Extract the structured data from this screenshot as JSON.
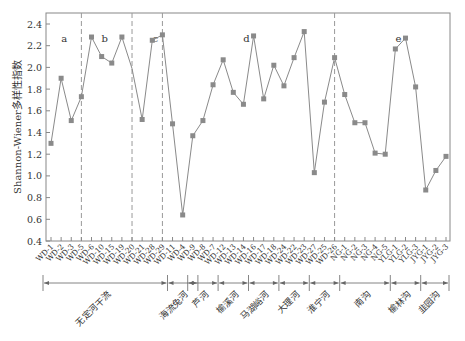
{
  "chart_data": {
    "type": "line",
    "title": "",
    "ylabel": "Shannon-Wiener多样性指数",
    "xlabel": "",
    "ylim": [
      0.4,
      2.5
    ],
    "yticks": [
      0.4,
      0.6,
      0.8,
      1.0,
      1.2,
      1.4,
      1.6,
      1.8,
      2.0,
      2.2,
      2.4
    ],
    "grid": false,
    "legend": "none",
    "line_color": "#8a8a8a",
    "marker_color": "#8a8a8a",
    "categories": [
      "WD-1",
      "WD-2",
      "WD-3",
      "WD-5",
      "WD-6",
      "WD-10",
      "WD-15",
      "WD-19",
      "WD-20",
      "WD-21",
      "WD-28",
      "WD-29",
      "WD-11",
      "WD-4",
      "WD-9",
      "WD-8",
      "WD-7",
      "WD-12",
      "WD-13",
      "WD-14",
      "WD-16",
      "WD-17",
      "WD-18",
      "WD-24",
      "WD-22",
      "WD-23",
      "WD-27",
      "WD-25",
      "WD-26",
      "NG-1",
      "NG-2",
      "NG-3",
      "NG-4",
      "NG-5",
      "YLG-1",
      "YLG-2",
      "YLG-3",
      "JYG-1",
      "JYG-2",
      "JYG-3"
    ],
    "series": [
      {
        "name": "Shannon-Wiener",
        "values": [
          1.3,
          1.9,
          1.51,
          1.73,
          2.28,
          2.1,
          2.04,
          2.28,
          1.99,
          1.52,
          2.25,
          2.3,
          1.48,
          0.64,
          1.37,
          1.51,
          1.84,
          2.07,
          1.77,
          1.66,
          2.29,
          1.71,
          2.02,
          1.83,
          2.09,
          2.33,
          1.03,
          1.68,
          2.09,
          1.75,
          1.49,
          1.49,
          1.21,
          1.2,
          2.17,
          2.27,
          1.82,
          0.87,
          1.05,
          1.18
        ]
      }
    ],
    "region_labels": [
      {
        "label": "a",
        "at_index": 1
      },
      {
        "label": "b",
        "at_index": 5
      },
      {
        "label": "c",
        "at_index": 10
      },
      {
        "label": "d",
        "at_index": 19
      },
      {
        "label": "e",
        "at_index": 34
      }
    ],
    "region_dividers_after_index": [
      3,
      8,
      11,
      28
    ],
    "groups": [
      {
        "name": "无定河干流",
        "start": 0,
        "end": 11
      },
      {
        "name": "海流兔河",
        "start": 12,
        "end": 14
      },
      {
        "name": "芦河",
        "start": 14,
        "end": 16
      },
      {
        "name": "榆溪河",
        "start": 17,
        "end": 19
      },
      {
        "name": "马湖峪河",
        "start": 20,
        "end": 22
      },
      {
        "name": "大理河",
        "start": 23,
        "end": 25
      },
      {
        "name": "淮宁河",
        "start": 26,
        "end": 28
      },
      {
        "name": "南沟",
        "start": 29,
        "end": 33
      },
      {
        "name": "榆林沟",
        "start": 34,
        "end": 36
      },
      {
        "name": "韭园沟",
        "start": 37,
        "end": 39
      }
    ]
  }
}
